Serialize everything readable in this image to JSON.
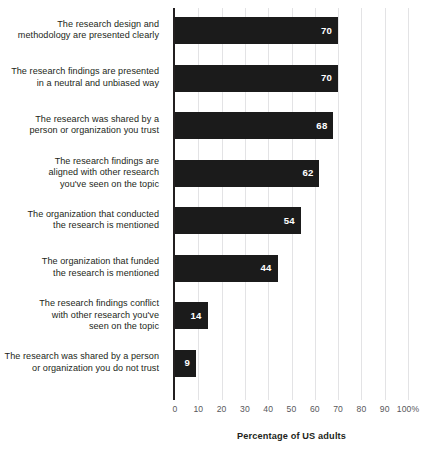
{
  "chart_data": {
    "type": "bar",
    "orientation": "horizontal",
    "title": "",
    "xlabel": "Percentage of US adults",
    "ylabel": "",
    "xlim": [
      0,
      100
    ],
    "grid": true,
    "legend": "none",
    "xticks": [
      "0",
      "10",
      "20",
      "30",
      "40",
      "50",
      "60",
      "70",
      "80",
      "90",
      "100%"
    ],
    "xtick_values": [
      0,
      10,
      20,
      30,
      40,
      50,
      60,
      70,
      80,
      90,
      100
    ],
    "categories": [
      "The research design and\nmethodology are presented clearly",
      "The research findings are presented\nin a neutral and unbiased way",
      "The research was shared by a\nperson or organization you trust",
      "The research findings are\naligned with other research\nyou've seen on the topic",
      "The organization that conducted\nthe research is mentioned",
      "The organization that funded\nthe research is mentioned",
      "The research findings conflict\nwith other research you've\nseen on the topic",
      "The research was shared by a person\nor organization you do not trust"
    ],
    "values": [
      70,
      70,
      68,
      62,
      54,
      44,
      14,
      9
    ],
    "value_labels": [
      "70",
      "70",
      "68",
      "62",
      "54",
      "44",
      "14",
      "9"
    ],
    "bar_color": "#1b1b1b",
    "value_label_color": "#ffffff",
    "gridline_color": "#e3e3e5",
    "axis_color": "#231f20",
    "tick_label_color": "#58585b",
    "background_color": "#ffffff"
  }
}
